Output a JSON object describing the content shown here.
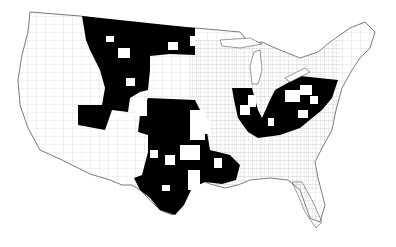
{
  "map": {
    "subject": "Contiguous United States county map",
    "background_color": "#ffffff",
    "highlight_color": "#000000",
    "border_color": "#555555",
    "highlighted_regions": [
      "Montana / North Dakota / Wyoming / Idaho (north-central plains)",
      "Utah / Colorado (west-central)",
      "Kansas / Oklahoma / Texas (southern plains)",
      "Louisiana (north-west)",
      "Illinois / Indiana / Ohio / Kentucky / Pennsylvania / West Virginia (Ohio River basin)"
    ]
  }
}
